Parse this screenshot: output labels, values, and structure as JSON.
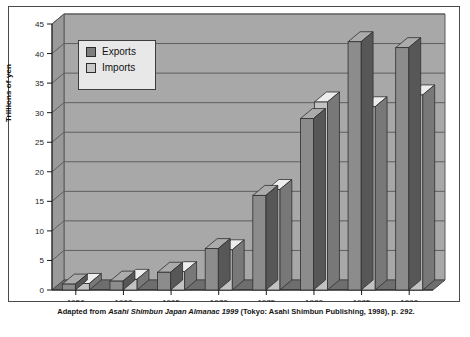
{
  "chart_data": {
    "type": "bar",
    "title": "",
    "subtitle": "",
    "xlabel": "",
    "ylabel": "Trillions of yen",
    "categories": [
      "1956",
      "1960",
      "1965",
      "1970",
      "1975",
      "1980",
      "1985",
      "1990"
    ],
    "series": [
      {
        "name": "Exports",
        "color": "#8c8c8c",
        "values": [
          1.0,
          1.5,
          3.0,
          7.0,
          16.0,
          29.0,
          42.0,
          41.0
        ]
      },
      {
        "name": "Imports",
        "color": "#c2c2c2",
        "values": [
          1.1,
          1.8,
          3.1,
          6.8,
          17.0,
          31.8,
          31.0,
          33.0
        ]
      }
    ],
    "ylim": [
      0,
      45
    ],
    "yticks": [
      0,
      5,
      10,
      15,
      20,
      25,
      30,
      35,
      40,
      45
    ],
    "ytick_labels": [
      "0",
      "5",
      "10",
      "15",
      "20",
      "25",
      "30",
      "35",
      "40",
      "45"
    ],
    "grid": true,
    "grid_axis": "y",
    "legend_position": "upper-left",
    "style": "3d-bar-grayscale",
    "plot_background": "#a8a8a8",
    "floor_color": "#6e6e6e"
  },
  "legend": {
    "items": [
      {
        "label": "Exports",
        "swatch": "#7d7d7d"
      },
      {
        "label": "Imports",
        "swatch": "#c8c8c8"
      }
    ]
  },
  "caption": {
    "prefix": "Adapted from ",
    "italic_title": "Asahi Shimbun Japan Almanac 1999",
    "suffix": " (Tokyo: Asahi Shimbun Publishing, 1998), p. 292."
  }
}
